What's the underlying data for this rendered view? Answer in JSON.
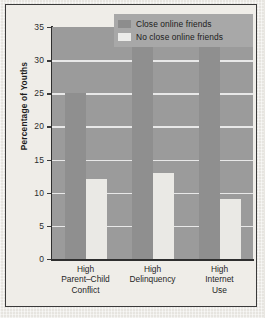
{
  "figure": {
    "paper_color": "#edebe6",
    "frame_color": "#3a3a3a",
    "plot_bg": "#9b9b9b",
    "gridline_color": "#efefef"
  },
  "legend": {
    "position": "top-right-overlay",
    "background": "#a8a8a8",
    "entries": [
      {
        "label": "Close online friends",
        "color": "#8d8d8d",
        "swatch_name": "legend-swatch-close-online-friends"
      },
      {
        "label": "No close online friends",
        "color": "#ececea",
        "swatch_name": "legend-swatch-no-close-online-friends"
      }
    ]
  },
  "chart_data": {
    "type": "bar",
    "title": "",
    "xlabel": "",
    "ylabel": "Percentage of Youths",
    "ylim": [
      0,
      35
    ],
    "yticks": [
      0,
      5,
      10,
      15,
      20,
      25,
      30,
      35
    ],
    "ytick_labels": [
      "0",
      "5",
      "10",
      "15",
      "20",
      "25",
      "30",
      "35"
    ],
    "grid": true,
    "grid_axis": "y",
    "legend_position": "upper right",
    "categories": [
      "High\nParent–Child\nConflict",
      "High\nDelinquency",
      "High\nInternet\nUse"
    ],
    "category_lines": [
      [
        "High",
        "Parent–Child",
        "Conflict"
      ],
      [
        "High",
        "Delinquency"
      ],
      [
        "High",
        "Internet",
        "Use"
      ]
    ],
    "series": [
      {
        "name": "Close online friends",
        "color": "#8f8f8f",
        "values": [
          25,
          35,
          35
        ]
      },
      {
        "name": "No close online friends",
        "color": "#eae9e5",
        "values": [
          12,
          13,
          9
        ]
      }
    ]
  }
}
